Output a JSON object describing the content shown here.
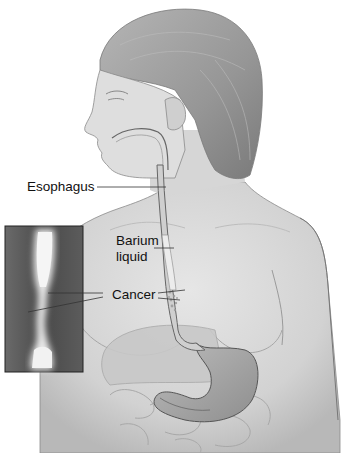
{
  "figure": {
    "labels": {
      "esophagus": "Esophagus",
      "barium_line1": "Barium",
      "barium_line2": "liquid",
      "cancer": "Cancer"
    },
    "inset": {
      "description": "X-ray inset of barium-filled esophagus with narrowing"
    },
    "colors": {
      "background": "#ffffff",
      "skin": "#d9d9d9",
      "skin_shadow": "#a8a8a8",
      "hair": "#9a9a9a",
      "xray_bg": "#555555",
      "xray_barium": "#eeeeee",
      "text": "#111111",
      "leader_line": "#333333"
    }
  }
}
